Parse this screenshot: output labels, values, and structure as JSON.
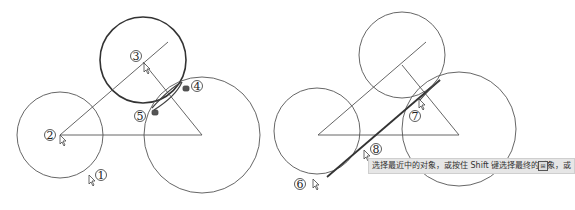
{
  "figure": {
    "left_panel": {
      "markers": [
        {
          "id": "marker-1",
          "label": "①"
        },
        {
          "id": "marker-2",
          "label": "②"
        },
        {
          "id": "marker-3",
          "label": "③"
        },
        {
          "id": "marker-4",
          "label": "④"
        },
        {
          "id": "marker-5",
          "label": "⑤"
        }
      ]
    },
    "right_panel": {
      "markers": [
        {
          "id": "marker-6",
          "label": "⑥"
        },
        {
          "id": "marker-7",
          "label": "⑦"
        },
        {
          "id": "marker-8",
          "label": "⑧"
        }
      ],
      "tooltip": {
        "text": "选择最近中的对象，或按住 Shift 键选择最终的对象，或",
        "icon": "expand-icon"
      }
    }
  },
  "colors": {
    "line": "#555555",
    "bold_line": "#333333",
    "tooltip_bg": "#e6e6e6"
  }
}
